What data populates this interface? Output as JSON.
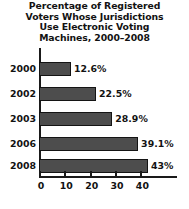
{
  "chart_data": {
    "type": "bar",
    "orientation": "horizontal",
    "title": "Percentage of Registered Voters Whose Jurisdictions Use Electronic Voting Machines, 2000–2008",
    "title_lines": [
      "Percentage of Registered",
      "Voters Whose Jurisdictions",
      "Use Electronic Voting",
      "Machines, 2000–2008"
    ],
    "categories": [
      "2000",
      "2002",
      "2003",
      "2006",
      "2008"
    ],
    "values": [
      12.6,
      22.5,
      28.9,
      39.1,
      43
    ],
    "value_labels": [
      "12.6%",
      "22.5%",
      "28.9%",
      "39.1%",
      "43%"
    ],
    "xlabel": "",
    "ylabel": "",
    "xlim": [
      0,
      47
    ],
    "xticks": [
      0,
      10,
      20,
      30,
      40
    ],
    "xtick_labels": [
      "0",
      "10",
      "20",
      "30",
      "40"
    ],
    "grid": false,
    "legend": false,
    "colors": {
      "bar_fill": "#4d4d4d",
      "bar_border": "#141414",
      "axis": "#1a1a1a",
      "text": "#121212",
      "background": "#ffffff"
    }
  }
}
